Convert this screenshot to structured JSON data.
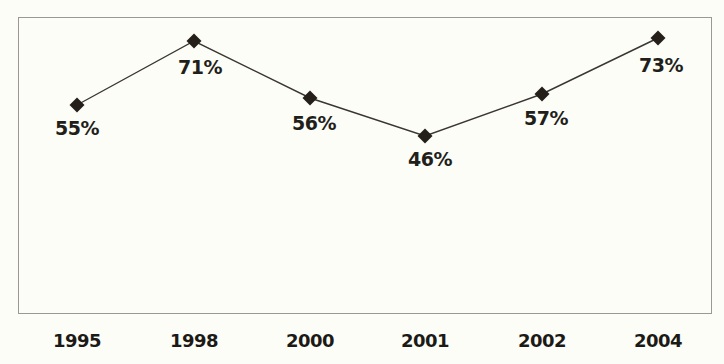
{
  "chart_data": {
    "type": "line",
    "title": "",
    "title_note": "title-clipped-at-top-edge",
    "xlabel": "",
    "ylabel": "",
    "categories": [
      "1995",
      "1998",
      "2000",
      "2001",
      "2002",
      "2004"
    ],
    "values": [
      55,
      71,
      56,
      46,
      57,
      73
    ],
    "value_labels": [
      "55%",
      "71%",
      "56%",
      "46%",
      "57%",
      "73%"
    ],
    "series": [
      {
        "name": "",
        "values": [
          55,
          71,
          56,
          46,
          57,
          73
        ]
      }
    ],
    "ylim": [
      40,
      78
    ],
    "grid": false,
    "legend": false,
    "marker": "diamond",
    "line_color": "#3a3630",
    "marker_color": "#241f19",
    "background_color": "#fdfdf8",
    "border_color": "#9a9a93",
    "points": [
      {
        "category": "1995",
        "value": 55,
        "label": "55%",
        "x": 77,
        "y": 105,
        "label_x": 77,
        "label_y": 117
      },
      {
        "category": "1998",
        "value": 71,
        "label": "71%",
        "x": 194,
        "y": 41,
        "label_x": 200,
        "label_y": 56
      },
      {
        "category": "2000",
        "value": 56,
        "label": "56%",
        "x": 310,
        "y": 98,
        "label_x": 314,
        "label_y": 112
      },
      {
        "category": "2001",
        "value": 46,
        "label": "46%",
        "x": 425,
        "y": 136,
        "label_x": 430,
        "label_y": 148
      },
      {
        "category": "2002",
        "value": 57,
        "label": "57%",
        "x": 542,
        "y": 94,
        "label_x": 546,
        "label_y": 107
      },
      {
        "category": "2004",
        "value": 73,
        "label": "73%",
        "x": 658,
        "y": 38,
        "label_x": 661,
        "label_y": 54
      }
    ],
    "year_label_positions": [
      77,
      194,
      310,
      425,
      542,
      658
    ]
  }
}
